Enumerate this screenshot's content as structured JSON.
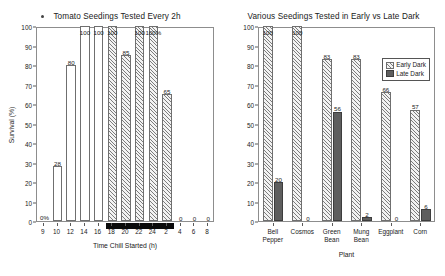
{
  "chart_data": [
    {
      "type": "bar",
      "panel": "left",
      "title": "Tomato Seedings Tested Every 2h",
      "xlabel": "Time Chill Started (h)",
      "ylabel": "Survival (%)",
      "ylim": [
        0,
        100
      ],
      "yticks": [
        0,
        10,
        20,
        30,
        40,
        50,
        60,
        70,
        80,
        90,
        100
      ],
      "xticks": [
        "9",
        "10",
        "12",
        "14",
        "16",
        "18",
        "20",
        "22",
        "24",
        "2",
        "4",
        "6",
        "8"
      ],
      "grid": false,
      "legend": "none",
      "night_band": {
        "start_hour": "17",
        "end_hour": "3",
        "color": "#0a0a0a"
      },
      "categories": [
        "9",
        "10",
        "12",
        "14",
        "16",
        "18",
        "20",
        "22",
        "24",
        "2",
        "4",
        "6",
        "8"
      ],
      "values": [
        0,
        28,
        80,
        100,
        100,
        100,
        85,
        100,
        100,
        65,
        0,
        0,
        0
      ],
      "point_labels": [
        "0%",
        "28",
        "80",
        "100",
        "100",
        "100",
        "85",
        "100",
        "100%",
        "65",
        "0",
        "0",
        "0"
      ],
      "fills": [
        "open",
        "open",
        "open",
        "open",
        "open",
        "hatch",
        "hatch",
        "hatch",
        "hatch",
        "hatch",
        "none",
        "none",
        "none"
      ]
    },
    {
      "type": "bar",
      "panel": "right",
      "title": "Various Seedings Tested in Early vs Late Dark",
      "xlabel": "Plant",
      "ylabel": "Survival (%)",
      "ylim": [
        0,
        100
      ],
      "yticks": [
        0,
        10,
        20,
        30,
        40,
        50,
        60,
        70,
        80,
        90,
        100
      ],
      "grid": false,
      "legend_position": "top-right",
      "categories": [
        "Bell Pepper",
        "Cosmos",
        "Green Bean",
        "Mung Bean",
        "Eggplant",
        "Corn"
      ],
      "series": [
        {
          "name": "Early Dark",
          "fill": "hatch",
          "values": [
            100,
            100,
            83,
            83,
            66,
            57
          ],
          "point_labels": [
            "100",
            "100",
            "83",
            "83",
            "66",
            "57"
          ]
        },
        {
          "name": "Late Dark",
          "fill": "solid",
          "values": [
            20,
            0,
            56,
            2,
            0,
            6
          ],
          "point_labels": [
            "20",
            "0",
            "56",
            "2",
            "0",
            "6"
          ]
        }
      ]
    }
  ],
  "colors": {
    "axis": "#8d8d8d",
    "text": "#1a1a1a",
    "hatch": "#7c7c7c",
    "solid_fill": "#5e5e5e",
    "night": "#0a0a0a"
  }
}
